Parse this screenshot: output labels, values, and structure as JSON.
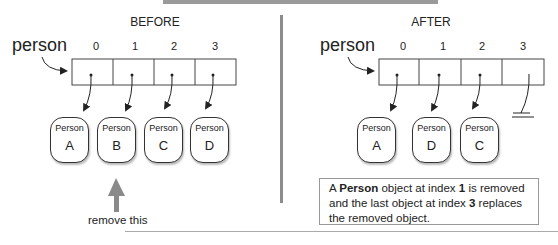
{
  "before": {
    "heading": "BEFORE",
    "variable": "person",
    "indices": [
      "0",
      "1",
      "2",
      "3"
    ],
    "objects": [
      {
        "class": "Person",
        "label": "A"
      },
      {
        "class": "Person",
        "label": "B"
      },
      {
        "class": "Person",
        "label": "C"
      },
      {
        "class": "Person",
        "label": "D"
      }
    ],
    "arrow_label": "remove this"
  },
  "after": {
    "heading": "AFTER",
    "variable": "person",
    "indices": [
      "0",
      "1",
      "2",
      "3"
    ],
    "objects": [
      {
        "class": "Person",
        "label": "A"
      },
      {
        "class": "Person",
        "label": "D"
      },
      {
        "class": "Person",
        "label": "C"
      }
    ],
    "null_slot": "3",
    "note": {
      "part1": "A ",
      "bold1": "Person",
      "part2": " object at index ",
      "bold2": "1",
      "part3": " is removed and the last object at index ",
      "bold3": "3",
      "part4": " replaces the removed object."
    }
  },
  "colors": {
    "line": "#333333",
    "divider": "#8c8c8c",
    "remove_arrow": "#8a8a8a"
  }
}
